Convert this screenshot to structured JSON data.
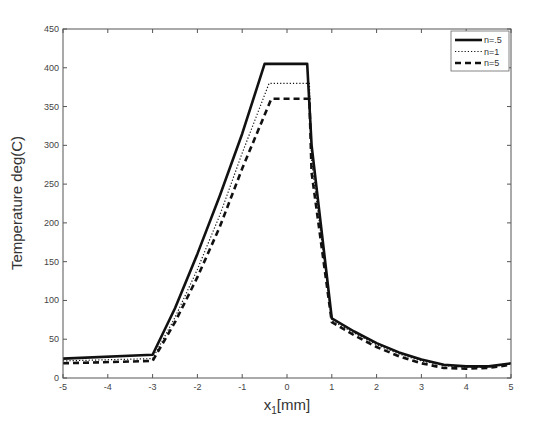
{
  "chart_data": {
    "type": "line",
    "title": "",
    "xlabel": "x_1[mm]",
    "xlabel_main": "x",
    "xlabel_sub": "1",
    "xlabel_suffix": "[mm]",
    "ylabel": "Temperature deg(C)",
    "xlim": [
      -5,
      5
    ],
    "ylim": [
      0,
      450
    ],
    "xticks": [
      -5,
      -4,
      -3,
      -2,
      -1,
      0,
      1,
      2,
      3,
      4,
      5
    ],
    "yticks": [
      0,
      50,
      100,
      150,
      200,
      250,
      300,
      350,
      400,
      450
    ],
    "grid": false,
    "legend_position": "upper right",
    "series": [
      {
        "name": "n=.5",
        "style": "solid",
        "x": [
          -5,
          -3,
          -2.5,
          -2,
          -1.5,
          -1,
          -0.5,
          0.45,
          0.55,
          1,
          1.5,
          2,
          2.5,
          3,
          3.5,
          4,
          4.5,
          5
        ],
        "y": [
          25,
          30,
          90,
          160,
          235,
          315,
          405,
          405,
          300,
          77,
          60,
          45,
          33,
          24,
          17,
          15,
          15,
          19
        ]
      },
      {
        "name": "n=1",
        "style": "dotted",
        "x": [
          -5,
          -3,
          -2.5,
          -2,
          -1.5,
          -1,
          -0.4,
          0.5,
          0.55,
          1,
          1.5,
          2,
          2.5,
          3,
          3.5,
          4,
          4.5,
          5
        ],
        "y": [
          22,
          25,
          78,
          140,
          210,
          290,
          380,
          380,
          280,
          74,
          58,
          43,
          31,
          22,
          16,
          14,
          14,
          18
        ]
      },
      {
        "name": "n=5",
        "style": "dashed",
        "x": [
          -5,
          -3,
          -2.5,
          -2,
          -1.5,
          -1,
          -0.35,
          0.5,
          0.55,
          1,
          1.5,
          2,
          2.5,
          3,
          3.5,
          4,
          4.5,
          5
        ],
        "y": [
          19,
          22,
          72,
          130,
          195,
          270,
          360,
          360,
          265,
          72,
          55,
          40,
          28,
          19,
          13,
          12,
          13,
          17
        ]
      }
    ]
  }
}
